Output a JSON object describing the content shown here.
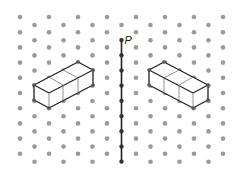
{
  "diagram": {
    "type": "isometric-dot-grid-reflection",
    "grid": {
      "columns": 15,
      "x_start": 20,
      "x_step": 14.5,
      "even_col_y_start": 17,
      "odd_col_y_start": 25,
      "y_step": 15.2,
      "rows": 10,
      "dot_color": "#9a9a9a",
      "dot_radius": 2.3
    },
    "mirror_line": {
      "label": "P",
      "x": 121.5,
      "y_top": 40,
      "y_bottom": 162,
      "color": "#222222"
    },
    "shapes": [
      {
        "name": "left-cuboid",
        "description": "Three unit cubes in a row",
        "outline": [
          [
            34,
            85
          ],
          [
            78,
            62
          ],
          [
            93,
            70
          ],
          [
            93,
            85
          ],
          [
            49,
            108
          ],
          [
            34,
            100
          ]
        ],
        "inner_edges": [
          [
            [
              34,
              85
            ],
            [
              49,
              93
            ]
          ],
          [
            [
              49,
              93
            ],
            [
              93,
              70
            ]
          ],
          [
            [
              49,
              93
            ],
            [
              49,
              108
            ]
          ],
          [
            [
              63,
              85
            ],
            [
              63,
              100
            ]
          ],
          [
            [
              78,
              78
            ],
            [
              78,
              93
            ]
          ],
          [
            [
              49,
              77
            ],
            [
              63,
              85
            ]
          ],
          [
            [
              63,
              70
            ],
            [
              78,
              78
            ]
          ]
        ]
      },
      {
        "name": "right-cuboid",
        "description": "Mirror image of three unit cubes in a row",
        "outline": [
          [
            208,
            85
          ],
          [
            164,
            62
          ],
          [
            149,
            70
          ],
          [
            149,
            85
          ],
          [
            193,
            108
          ],
          [
            208,
            100
          ]
        ],
        "inner_edges": [
          [
            [
              208,
              85
            ],
            [
              193,
              93
            ]
          ],
          [
            [
              193,
              93
            ],
            [
              149,
              70
            ]
          ],
          [
            [
              193,
              93
            ],
            [
              193,
              108
            ]
          ],
          [
            [
              179,
              85
            ],
            [
              179,
              100
            ]
          ],
          [
            [
              164,
              78
            ],
            [
              164,
              93
            ]
          ],
          [
            [
              193,
              77
            ],
            [
              179,
              85
            ]
          ],
          [
            [
              179,
              70
            ],
            [
              164,
              78
            ]
          ]
        ]
      }
    ],
    "edge_color": "#222222",
    "inner_edge_color": "#777777"
  }
}
